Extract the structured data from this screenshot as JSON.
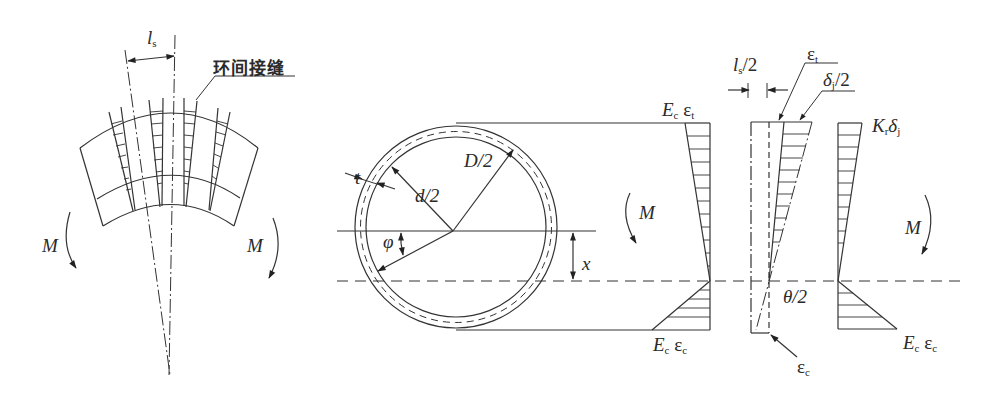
{
  "figure": {
    "left_panel": {
      "title_label": "环间接缝",
      "dimension": {
        "symbol": "l",
        "sub": "s"
      },
      "moment_left": "M",
      "moment_right": "M"
    },
    "section_panel": {
      "thickness": "t",
      "inner_radius": "d/2",
      "outer_radius": "D/2",
      "angle": "φ",
      "neutral_offset": "x",
      "moment": "M"
    },
    "concrete_stress": {
      "top": {
        "E": "E",
        "E_sub": "c",
        "eps": "ε",
        "eps_sub": "t"
      },
      "bottom": {
        "E": "E",
        "E_sub": "c",
        "eps": "ε",
        "eps_sub": "c"
      }
    },
    "strain_diagram": {
      "half_width": {
        "symbol": "l",
        "sub": "s",
        "suffix": "/2"
      },
      "top_strain": {
        "eps": "ε",
        "sub": "t"
      },
      "joint_opening": {
        "symbol": "δ",
        "sub": "j",
        "suffix": "/2"
      },
      "rotation": "θ/2",
      "bottom_strain": {
        "eps": "ε",
        "sub": "c"
      }
    },
    "joint_stress": {
      "top": {
        "K": "K",
        "K_sub": "r",
        "delta": "δ",
        "delta_sub": "j"
      },
      "bottom": {
        "E": "E",
        "E_sub": "c",
        "eps": "ε",
        "eps_sub": "c"
      },
      "moment": "M"
    }
  }
}
